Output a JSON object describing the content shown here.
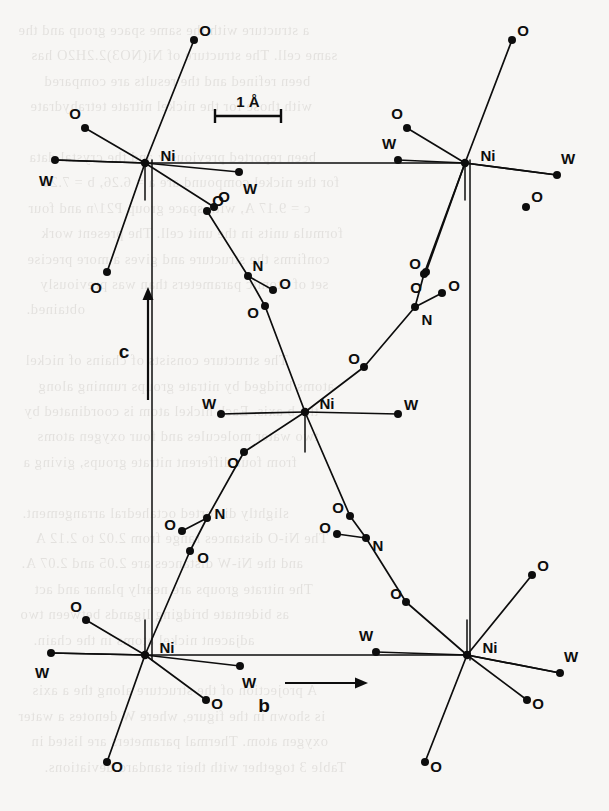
{
  "figure": {
    "type": "crystal-structure-projection",
    "scale_bar": {
      "text": "1 Å",
      "length_px": 66,
      "x": 248,
      "y": 107
    },
    "axes": [
      {
        "name": "c",
        "label": "c",
        "direction": "up",
        "x": 124,
        "y": 352
      },
      {
        "name": "b",
        "label": "b",
        "direction": "right",
        "x": 264,
        "y": 706
      }
    ],
    "unit_cell": {
      "left_x": 152,
      "right_x": 470,
      "top_y": 160,
      "bottom_y": 660
    },
    "bleed_text": [
      "a structure with the same space group and the",
      "same cell. The structure of Ni(NO3)2.2H2O has",
      "been refined and the results are compared",
      "with those for the nickel nitrate tetrahydrate",
      "",
      "been reported previously and the crystal data",
      "for the nickel compound are a = 6.26, b = 7.21",
      "c = 9.17 A, with space group P21/n and four",
      "formula units in the unit cell. The present work",
      "confirms the structure and gives a more precise",
      "set of atomic parameters than was previously",
      "obtained.",
      "",
      "The structure consists of chains of nickel",
      "atoms bridged by nitrate groups running along",
      "the b axis. Each nickel atom is coordinated by",
      "two water molecules and four oxygen atoms",
      "from four different nitrate groups, giving a",
      "",
      "slightly distorted octahedral arrangement.",
      "The Ni-O distances range from 2.02 to 2.12 A",
      "and the Ni-W distances are 2.05 and 2.07 A.",
      "The nitrate groups are nearly planar and act",
      "as bidentate bridging ligands between two",
      "adjacent nickel atoms in the chain.",
      "",
      "A projection of the structure along the a axis",
      "is shown in the figure, where W denotes a water",
      "oxygen atom. Thermal parameters are listed in",
      "Table 3 together with their standard deviations."
    ],
    "atom_types": {
      "Ni": {
        "label": "Ni",
        "name": "nickel",
        "radius": 4.2
      },
      "O": {
        "label": "O",
        "name": "oxygen",
        "radius": 4.0
      },
      "N": {
        "label": "N",
        "name": "nitrogen",
        "radius": 4.0
      },
      "W": {
        "label": "W",
        "name": "water-oxygen",
        "radius": 4.0
      }
    },
    "colors": {
      "ink": "#0d0d0d",
      "paper": "#f7f6f4",
      "bleed": "#4a4138"
    },
    "atoms": [
      {
        "id": "Ni1",
        "type": "Ni",
        "x": 145,
        "y": 163,
        "lx": 168,
        "ly": 155
      },
      {
        "id": "Ni2",
        "type": "Ni",
        "x": 465,
        "y": 163,
        "lx": 488,
        "ly": 155
      },
      {
        "id": "Ni3",
        "type": "Ni",
        "x": 305,
        "y": 412,
        "lx": 327,
        "ly": 403
      },
      {
        "id": "Ni4",
        "type": "Ni",
        "x": 145,
        "y": 655,
        "lx": 167,
        "ly": 647
      },
      {
        "id": "Ni5",
        "type": "Ni",
        "x": 467,
        "y": 655,
        "lx": 490,
        "ly": 647
      },
      {
        "id": "O_a1",
        "type": "O",
        "x": 194,
        "y": 40,
        "lx": 205,
        "ly": 30
      },
      {
        "id": "O_a2",
        "type": "O",
        "x": 85,
        "y": 128,
        "lx": 75,
        "ly": 113
      },
      {
        "id": "W_a1",
        "type": "W",
        "x": 55,
        "y": 160,
        "lx": 46,
        "ly": 180
      },
      {
        "id": "W_a2",
        "type": "W",
        "x": 239,
        "y": 172,
        "lx": 250,
        "ly": 188
      },
      {
        "id": "O_a3",
        "type": "O",
        "x": 214,
        "y": 207,
        "lx": 224,
        "ly": 196
      },
      {
        "id": "O_a4",
        "type": "O",
        "x": 107,
        "y": 272,
        "lx": 96,
        "ly": 287
      },
      {
        "id": "O_b1",
        "type": "O",
        "x": 512,
        "y": 40,
        "lx": 523,
        "ly": 30
      },
      {
        "id": "O_b2",
        "type": "O",
        "x": 407,
        "y": 128,
        "lx": 397,
        "ly": 113
      },
      {
        "id": "W_b1",
        "type": "W",
        "x": 398,
        "y": 160,
        "lx": 389,
        "ly": 143
      },
      {
        "id": "W_b2",
        "type": "W",
        "x": 557,
        "y": 175,
        "lx": 568,
        "ly": 158
      },
      {
        "id": "O_b3",
        "type": "O",
        "x": 526,
        "y": 207,
        "lx": 537,
        "ly": 196
      },
      {
        "id": "O_b4",
        "type": "O",
        "x": 426,
        "y": 272,
        "lx": 416,
        "ly": 287
      },
      {
        "id": "O_n1",
        "type": "O",
        "x": 207,
        "y": 211,
        "lx": 218,
        "ly": 200
      },
      {
        "id": "N_n1",
        "type": "N",
        "x": 248,
        "y": 276,
        "lx": 258,
        "ly": 265
      },
      {
        "id": "O_n2",
        "type": "O",
        "x": 273,
        "y": 290,
        "lx": 285,
        "ly": 283
      },
      {
        "id": "O_n3",
        "type": "O",
        "x": 265,
        "y": 306,
        "lx": 253,
        "ly": 312
      },
      {
        "id": "O_n4",
        "type": "O",
        "x": 424,
        "y": 274,
        "lx": 415,
        "ly": 263
      },
      {
        "id": "O_n5",
        "type": "O",
        "x": 442,
        "y": 293,
        "lx": 454,
        "ly": 285
      },
      {
        "id": "N_n2",
        "type": "N",
        "x": 415,
        "y": 307,
        "lx": 427,
        "ly": 319
      },
      {
        "id": "O_n6",
        "type": "O",
        "x": 364,
        "y": 367,
        "lx": 354,
        "ly": 358
      },
      {
        "id": "W_c1",
        "type": "W",
        "x": 221,
        "y": 414,
        "lx": 209,
        "ly": 403
      },
      {
        "id": "W_c2",
        "type": "W",
        "x": 398,
        "y": 414,
        "lx": 411,
        "ly": 404
      },
      {
        "id": "O_n7",
        "type": "O",
        "x": 244,
        "y": 452,
        "lx": 233,
        "ly": 462
      },
      {
        "id": "N_n3",
        "type": "N",
        "x": 207,
        "y": 518,
        "lx": 220,
        "ly": 513
      },
      {
        "id": "O_n8",
        "type": "O",
        "x": 182,
        "y": 531,
        "lx": 170,
        "ly": 524
      },
      {
        "id": "O_n9",
        "type": "O",
        "x": 190,
        "y": 551,
        "lx": 203,
        "ly": 557
      },
      {
        "id": "O_n10",
        "type": "O",
        "x": 350,
        "y": 516,
        "lx": 338,
        "ly": 507
      },
      {
        "id": "O_n11",
        "type": "O",
        "x": 337,
        "y": 534,
        "lx": 325,
        "ly": 527
      },
      {
        "id": "N_n4",
        "type": "N",
        "x": 366,
        "y": 538,
        "lx": 378,
        "ly": 545
      },
      {
        "id": "O_n12",
        "type": "O",
        "x": 406,
        "y": 602,
        "lx": 396,
        "ly": 593
      },
      {
        "id": "O_d1",
        "type": "O",
        "x": 86,
        "y": 620,
        "lx": 76,
        "ly": 606
      },
      {
        "id": "W_d1",
        "type": "W",
        "x": 51,
        "y": 653,
        "lx": 42,
        "ly": 672
      },
      {
        "id": "W_d2",
        "type": "W",
        "x": 240,
        "y": 666,
        "lx": 249,
        "ly": 682
      },
      {
        "id": "O_d2",
        "type": "O",
        "x": 206,
        "y": 700,
        "lx": 217,
        "ly": 703
      },
      {
        "id": "O_d3",
        "type": "O",
        "x": 107,
        "y": 762,
        "lx": 117,
        "ly": 766
      },
      {
        "id": "O_e1",
        "type": "O",
        "x": 532,
        "y": 575,
        "lx": 543,
        "ly": 565
      },
      {
        "id": "W_e1",
        "type": "W",
        "x": 376,
        "y": 652,
        "lx": 366,
        "ly": 635
      },
      {
        "id": "W_e2",
        "type": "W",
        "x": 560,
        "y": 673,
        "lx": 571,
        "ly": 656
      },
      {
        "id": "O_e2",
        "type": "O",
        "x": 527,
        "y": 700,
        "lx": 538,
        "ly": 703
      },
      {
        "id": "O_e3",
        "type": "O",
        "x": 425,
        "y": 762,
        "lx": 436,
        "ly": 766
      }
    ],
    "bonds": [
      {
        "from": "Ni1",
        "to": "O_a1",
        "w": 1.7
      },
      {
        "from": "Ni1",
        "to": "O_a2",
        "w": 1.7
      },
      {
        "from": "Ni1",
        "to": "W_a1",
        "w": 1.7
      },
      {
        "from": "Ni1",
        "to": "W_a2",
        "w": 1.7
      },
      {
        "from": "Ni1",
        "to": "O_a3",
        "w": 1.7
      },
      {
        "from": "Ni1",
        "to": "O_a4",
        "w": 1.7
      },
      {
        "from": "Ni2",
        "to": "O_b1",
        "w": 1.7
      },
      {
        "from": "Ni2",
        "to": "O_b2",
        "w": 1.7
      },
      {
        "from": "Ni2",
        "to": "W_b1",
        "w": 1.7
      },
      {
        "from": "Ni2",
        "to": "W_b2",
        "w": 1.7
      },
      {
        "from": "Ni2",
        "to": "O_b4",
        "w": 1.7
      },
      {
        "from": "O_n1",
        "to": "N_n1",
        "w": 1.7
      },
      {
        "from": "N_n1",
        "to": "O_n2",
        "w": 1.7
      },
      {
        "from": "N_n1",
        "to": "O_n3",
        "w": 1.7
      },
      {
        "from": "O_n3",
        "to": "Ni3",
        "w": 1.7
      },
      {
        "from": "O_n4",
        "to": "N_n2",
        "w": 1.7
      },
      {
        "from": "N_n2",
        "to": "O_n5",
        "w": 1.7
      },
      {
        "from": "N_n2",
        "to": "O_n6",
        "w": 1.7
      },
      {
        "from": "O_n6",
        "to": "Ni3",
        "w": 1.7
      },
      {
        "from": "O_n4",
        "to": "Ni2",
        "w": 1.7
      },
      {
        "from": "Ni3",
        "to": "W_c1",
        "w": 1.7
      },
      {
        "from": "Ni3",
        "to": "W_c2",
        "w": 1.7
      },
      {
        "from": "Ni3",
        "to": "O_n7",
        "w": 1.7
      },
      {
        "from": "O_n7",
        "to": "N_n3",
        "w": 1.7
      },
      {
        "from": "N_n3",
        "to": "O_n8",
        "w": 1.7
      },
      {
        "from": "N_n3",
        "to": "O_n9",
        "w": 1.7
      },
      {
        "from": "O_n9",
        "to": "Ni4",
        "w": 1.7
      },
      {
        "from": "Ni3",
        "to": "O_n10",
        "w": 1.7
      },
      {
        "from": "O_n10",
        "to": "N_n4",
        "w": 1.7
      },
      {
        "from": "N_n4",
        "to": "O_n11",
        "w": 1.7
      },
      {
        "from": "N_n4",
        "to": "O_n12",
        "w": 1.7
      },
      {
        "from": "O_n12",
        "to": "Ni5",
        "w": 1.7
      },
      {
        "from": "Ni4",
        "to": "O_d1",
        "w": 1.7
      },
      {
        "from": "Ni4",
        "to": "W_d1",
        "w": 1.7
      },
      {
        "from": "Ni4",
        "to": "W_d2",
        "w": 1.7
      },
      {
        "from": "Ni4",
        "to": "O_d2",
        "w": 1.7
      },
      {
        "from": "Ni4",
        "to": "O_d3",
        "w": 1.7
      },
      {
        "from": "Ni5",
        "to": "O_e1",
        "w": 1.7
      },
      {
        "from": "Ni5",
        "to": "W_e1",
        "w": 1.7
      },
      {
        "from": "Ni5",
        "to": "W_e2",
        "w": 1.7
      },
      {
        "from": "Ni5",
        "to": "O_e2",
        "w": 1.7
      },
      {
        "from": "Ni5",
        "to": "O_e3",
        "w": 1.7
      }
    ],
    "cell_edges": [
      {
        "x1": 152,
        "y1": 160,
        "x2": 152,
        "y2": 660,
        "w": 1.5
      },
      {
        "x1": 470,
        "y1": 160,
        "x2": 470,
        "y2": 660,
        "w": 1.5
      },
      {
        "x1": 145,
        "y1": 163,
        "x2": 465,
        "y2": 163,
        "w": 1.6
      },
      {
        "x1": 145,
        "y1": 655,
        "x2": 467,
        "y2": 655,
        "w": 1.6
      },
      {
        "x1": 145,
        "y1": 163,
        "x2": 145,
        "y2": 200,
        "w": 1.5
      },
      {
        "x1": 465,
        "y1": 163,
        "x2": 465,
        "y2": 200,
        "w": 1.5
      },
      {
        "x1": 305,
        "y1": 412,
        "x2": 305,
        "y2": 452,
        "w": 1.5
      },
      {
        "x1": 145,
        "y1": 620,
        "x2": 145,
        "y2": 655,
        "w": 1.5
      },
      {
        "x1": 467,
        "y1": 620,
        "x2": 467,
        "y2": 655,
        "w": 1.5
      },
      {
        "x1": 55,
        "y1": 160,
        "x2": 145,
        "y2": 163,
        "w": 1.6
      },
      {
        "x1": 465,
        "y1": 163,
        "x2": 557,
        "y2": 175,
        "w": 1.6
      },
      {
        "x1": 51,
        "y1": 653,
        "x2": 145,
        "y2": 655,
        "w": 1.6
      },
      {
        "x1": 467,
        "y1": 655,
        "x2": 560,
        "y2": 673,
        "w": 1.6
      }
    ]
  }
}
